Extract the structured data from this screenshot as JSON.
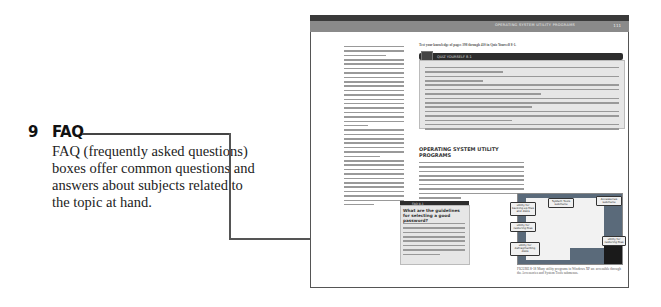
{
  "callout": {
    "number": "9",
    "title": "FAQ",
    "description": "FAQ (frequently asked questions) boxes offer common questions and answers about subjects related to the topic at hand.",
    "color_text": "#222222",
    "color_leader": "#555555"
  },
  "page": {
    "header_text": "OPERATING SYSTEM UTILITY PROGRAMS",
    "page_number": "111",
    "quiz_intro": "Test your knowledge of pages 398 through 410 in Quiz Yourself 8-1.",
    "quiz_bar_label": "QUIZ YOURSELF 8-1",
    "section_title": "OPERATING SYSTEM UTILITY PROGRAMS",
    "faq_bar_label": "FAQ 8-1",
    "faq_question": "What are the guidelines for selecting a good password?",
    "figure_caption": "FIGURE 8-18  Many utility programs in Windows XP are accessible through the Accessories and System Tools submenus.",
    "figure_callouts": [
      "utility for backing up files and disks",
      "System Tools submenu",
      "utility for restoring files",
      "utility for defragmenting disks",
      "Accessories submenu",
      "utility for restoring files"
    ]
  }
}
